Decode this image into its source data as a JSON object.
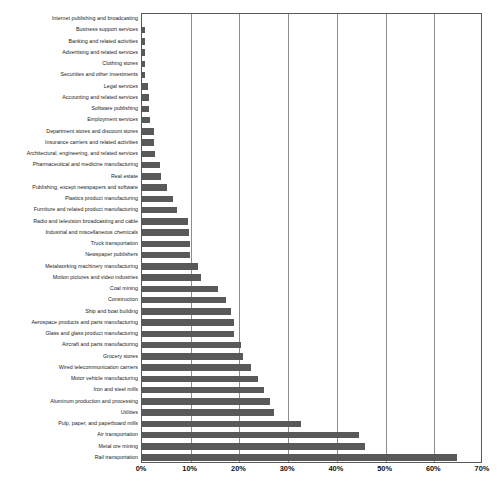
{
  "chart_data": {
    "type": "bar",
    "orientation": "horizontal",
    "title": "",
    "subtitle": "",
    "xlabel": "",
    "ylabel": "",
    "xlim": [
      0,
      70
    ],
    "ylim": null,
    "grid": true,
    "legend": null,
    "legend_position": "none",
    "bar_color": "#595959",
    "axis_color": "#5a5a5a",
    "gridline_color": "#8c8c8c",
    "xtick_labels": [
      "0%",
      "10%",
      "20%",
      "30%",
      "40%",
      "50%",
      "60%",
      "70%"
    ],
    "xtick_values": [
      0,
      10,
      20,
      30,
      40,
      50,
      60,
      70
    ],
    "categories": [
      "Internet publishing and broadcasting",
      "Business support services",
      "Banking and related activities",
      "Advertising and related services",
      "Clothing stores",
      "Securities and other investments",
      "Legal services",
      "Accounting and related services",
      "Software publishing",
      "Employment services",
      "Department stores and discount stores",
      "Insurance carriers and related activities",
      "Architectural, engineering, and related services",
      "Pharmaceutical and medicine manufacturing",
      "Real estate",
      "Publishing, except newspapers and software",
      "Plastics product manufacturing",
      "Furniture and related product manufacturing",
      "Radio and television broadcasting and cable",
      "Industrial and miscellaneous chemicals",
      "Truck transportation",
      "Newspaper publishers",
      "Metalworking machinery manufacturing",
      "Motion pictures and video industries",
      "Coal mining",
      "Construction",
      "Ship and boat building",
      "Aerospace products and parts manufacturing",
      "Glass and glass product manufacturing",
      "Aircraft and parts manufacturing",
      "Grocery stores",
      "Wired telecommunication carriers",
      "Motor vehicle manufacturing",
      "Iron and steel mills",
      "Aluminum production and processing",
      "Utilities",
      "Pulp, paper, and paperboard mills",
      "Air transportation",
      "Metal ore mining",
      "Rail transportation"
    ],
    "values": [
      0.2,
      0.8,
      0.8,
      0.8,
      0.8,
      0.8,
      1.5,
      1.6,
      1.6,
      1.9,
      2.6,
      2.7,
      2.8,
      3.9,
      4.1,
      5.4,
      6.5,
      7.3,
      9.6,
      9.9,
      10.0,
      10.0,
      11.6,
      12.3,
      15.9,
      17.5,
      18.5,
      19.0,
      19.0,
      20.6,
      21.0,
      22.6,
      24.1,
      25.3,
      26.5,
      27.4,
      32.8,
      44.8,
      45.9,
      64.8
    ]
  }
}
